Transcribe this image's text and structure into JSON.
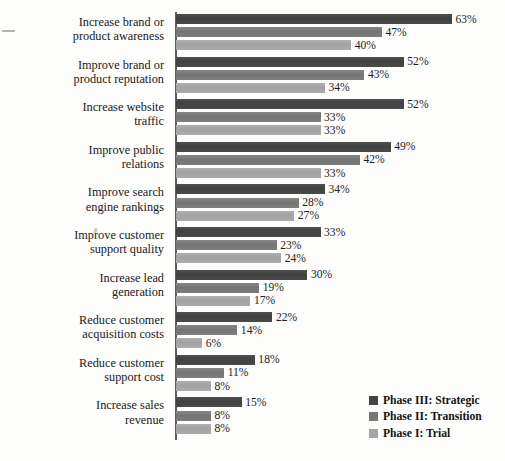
{
  "chart_data": {
    "type": "bar",
    "orientation": "horizontal",
    "title": "",
    "xlabel": "",
    "ylabel": "",
    "xlim": [
      0,
      63
    ],
    "grid": false,
    "value_suffix": "%",
    "legend_position": "bottom-right",
    "categories": [
      "Increase brand or product awareness",
      "Improve brand or product reputation",
      "Increase website traffic",
      "Improve public relations",
      "Improve search engine rankings",
      "Improve customer support quality",
      "Increase lead generation",
      "Reduce customer acquisition costs",
      "Reduce customer support cost",
      "Increase sales revenue"
    ],
    "category_lines": [
      [
        "Increase brand or",
        "product awareness"
      ],
      [
        "Improve brand or",
        "product reputation"
      ],
      [
        "Increase website",
        "traffic"
      ],
      [
        "Improve public",
        "relations"
      ],
      [
        "Improve search",
        "engine rankings"
      ],
      [
        "Improve customer",
        "support quality"
      ],
      [
        "Increase lead",
        "generation"
      ],
      [
        "Reduce customer",
        "acquisition costs"
      ],
      [
        "Reduce customer",
        "support cost"
      ],
      [
        "Increase sales",
        "revenue"
      ]
    ],
    "series": [
      {
        "name": "Phase III: Strategic",
        "color": "#444444",
        "values": [
          63,
          52,
          52,
          49,
          34,
          33,
          30,
          22,
          18,
          15
        ],
        "labels": [
          "63%",
          "52%",
          "52%",
          "49%",
          "34%",
          "33%",
          "30%",
          "22%",
          "18%",
          "15%"
        ]
      },
      {
        "name": "Phase II: Transition",
        "color": "#787878",
        "values": [
          47,
          43,
          33,
          42,
          28,
          23,
          19,
          14,
          11,
          8
        ],
        "labels": [
          "47%",
          "43%",
          "33%",
          "42%",
          "28%",
          "23%",
          "19%",
          "14%",
          "11%",
          "8%"
        ]
      },
      {
        "name": "Phase I: Trial",
        "color": "#a5a5a5",
        "values": [
          40,
          34,
          33,
          33,
          27,
          24,
          17,
          6,
          8,
          8
        ],
        "labels": [
          "40%",
          "34%",
          "33%",
          "33%",
          "27%",
          "24%",
          "17%",
          "6%",
          "8%",
          "8%"
        ]
      }
    ]
  },
  "legend": {
    "items": [
      {
        "label": "Phase III: Strategic"
      },
      {
        "label": "Phase II: Transition"
      },
      {
        "label": "Phase I: Trial"
      }
    ]
  }
}
